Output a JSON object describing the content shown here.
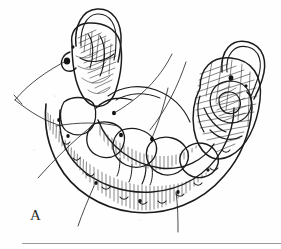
{
  "figure": {
    "panel_label": "A",
    "medium": "pen-and-ink-line-art",
    "background_color": "#fefefe",
    "ink_color": "#1b1b1b",
    "caption_rule_color": "#9a9a9a",
    "annotations": {
      "leader_line_count": 6,
      "pointer_dot_count": 9,
      "clasp_loop_count": 2
    },
    "parts": [
      {
        "name": "left-posterior-abutment-tooth",
        "has_wire_clasp": true
      },
      {
        "name": "right-posterior-abutment-tooth",
        "has_wire_clasp": true
      },
      {
        "name": "denture-base-hatched",
        "has_wire_clasp": false
      },
      {
        "name": "lingual-bar-major-connector",
        "has_wire_clasp": false
      },
      {
        "name": "residual-ridge-crest",
        "has_wire_clasp": false
      }
    ]
  }
}
